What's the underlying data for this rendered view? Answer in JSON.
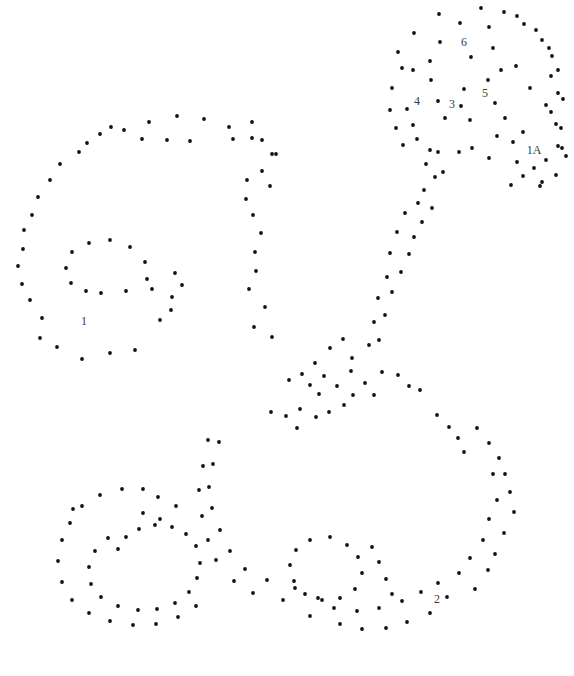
{
  "figure": {
    "title": "",
    "background_color": "#ffffff",
    "marker_color": "#111111",
    "label_color": "#3a3a3a",
    "marker_radius": 1.9,
    "width": 574,
    "height": 676
  },
  "chart_data": {
    "type": "scatter",
    "title": "",
    "xlabel": "",
    "ylabel": "",
    "xlim": [
      0,
      574
    ],
    "ylim": [
      676,
      0
    ],
    "grid": false,
    "legend": null,
    "axes_visible": false,
    "annotations": [
      {
        "text": "1",
        "x": 84,
        "y": 322
      },
      {
        "text": "1A",
        "x": 534,
        "y": 151
      },
      {
        "text": "2",
        "x": 437,
        "y": 600
      },
      {
        "text": "3",
        "x": 452,
        "y": 105
      },
      {
        "text": "4",
        "x": 417,
        "y": 102
      },
      {
        "text": "5",
        "x": 485,
        "y": 94
      },
      {
        "text": "6",
        "x": 464,
        "y": 43
      }
    ],
    "series": [
      {
        "name": "points",
        "marker": "filled-circle",
        "color": "#111111",
        "points": [
          [
            439,
            14
          ],
          [
            481,
            8
          ],
          [
            504,
            12
          ],
          [
            460,
            23
          ],
          [
            524,
            24
          ],
          [
            542,
            40
          ],
          [
            414,
            33
          ],
          [
            430,
            61
          ],
          [
            493,
            48
          ],
          [
            552,
            56
          ],
          [
            501,
            70
          ],
          [
            413,
            70
          ],
          [
            551,
            76
          ],
          [
            440,
            42
          ],
          [
            471,
            57
          ],
          [
            516,
            66
          ],
          [
            558,
            93
          ],
          [
            530,
            88
          ],
          [
            546,
            105
          ],
          [
            402,
            68
          ],
          [
            431,
            80
          ],
          [
            464,
            89
          ],
          [
            488,
            80
          ],
          [
            495,
            103
          ],
          [
            438,
            101
          ],
          [
            461,
            106
          ],
          [
            392,
            88
          ],
          [
            407,
            109
          ],
          [
            413,
            125
          ],
          [
            445,
            118
          ],
          [
            470,
            120
          ],
          [
            505,
            118
          ],
          [
            523,
            132
          ],
          [
            551,
            112
          ],
          [
            561,
            128
          ],
          [
            417,
            139
          ],
          [
            430,
            150
          ],
          [
            497,
            136
          ],
          [
            513,
            142
          ],
          [
            562,
            148
          ],
          [
            438,
            152
          ],
          [
            459,
            152
          ],
          [
            472,
            148
          ],
          [
            489,
            158
          ],
          [
            517,
            162
          ],
          [
            546,
            160
          ],
          [
            542,
            182
          ],
          [
            426,
            164
          ],
          [
            435,
            177
          ],
          [
            443,
            172
          ],
          [
            424,
            190
          ],
          [
            418,
            203
          ],
          [
            432,
            208
          ],
          [
            422,
            222
          ],
          [
            405,
            213
          ],
          [
            414,
            237
          ],
          [
            397,
            232
          ],
          [
            409,
            254
          ],
          [
            390,
            253
          ],
          [
            401,
            272
          ],
          [
            387,
            277
          ],
          [
            392,
            292
          ],
          [
            378,
            298
          ],
          [
            385,
            315
          ],
          [
            374,
            322
          ],
          [
            379,
            340
          ],
          [
            369,
            345
          ],
          [
            149,
            122
          ],
          [
            177,
            116
          ],
          [
            204,
            119
          ],
          [
            229,
            127
          ],
          [
            124,
            130
          ],
          [
            111,
            127
          ],
          [
            100,
            134
          ],
          [
            252,
            138
          ],
          [
            272,
            154
          ],
          [
            87,
            143
          ],
          [
            79,
            152
          ],
          [
            167,
            140
          ],
          [
            142,
            139
          ],
          [
            190,
            141
          ],
          [
            60,
            164
          ],
          [
            252,
            122
          ],
          [
            233,
            139
          ],
          [
            50,
            180
          ],
          [
            38,
            197
          ],
          [
            262,
            171
          ],
          [
            270,
            186
          ],
          [
            247,
            180
          ],
          [
            32,
            215
          ],
          [
            24,
            230
          ],
          [
            23,
            249
          ],
          [
            246,
            199
          ],
          [
            253,
            215
          ],
          [
            18,
            266
          ],
          [
            22,
            284
          ],
          [
            261,
            233
          ],
          [
            255,
            252
          ],
          [
            30,
            300
          ],
          [
            42,
            318
          ],
          [
            40,
            338
          ],
          [
            256,
            271
          ],
          [
            249,
            289
          ],
          [
            57,
            347
          ],
          [
            82,
            359
          ],
          [
            265,
            307
          ],
          [
            110,
            353
          ],
          [
            135,
            350
          ],
          [
            254,
            327
          ],
          [
            272,
            337
          ],
          [
            160,
            320
          ],
          [
            172,
            297
          ],
          [
            152,
            289
          ],
          [
            126,
            291
          ],
          [
            101,
            293
          ],
          [
            86,
            291
          ],
          [
            71,
            283
          ],
          [
            66,
            268
          ],
          [
            72,
            252
          ],
          [
            89,
            243
          ],
          [
            110,
            240
          ],
          [
            130,
            247
          ],
          [
            145,
            262
          ],
          [
            147,
            279
          ],
          [
            175,
            273
          ],
          [
            182,
            285
          ],
          [
            171,
            310
          ],
          [
            315,
            363
          ],
          [
            330,
            348
          ],
          [
            343,
            339
          ],
          [
            324,
            376
          ],
          [
            310,
            385
          ],
          [
            302,
            374
          ],
          [
            289,
            380
          ],
          [
            319,
            394
          ],
          [
            337,
            386
          ],
          [
            351,
            371
          ],
          [
            352,
            358
          ],
          [
            344,
            405
          ],
          [
            329,
            412
          ],
          [
            316,
            417
          ],
          [
            300,
            409
          ],
          [
            297,
            428
          ],
          [
            286,
            416
          ],
          [
            271,
            412
          ],
          [
            353,
            395
          ],
          [
            365,
            383
          ],
          [
            374,
            395
          ],
          [
            382,
            372
          ],
          [
            398,
            375
          ],
          [
            409,
            386
          ],
          [
            420,
            390
          ],
          [
            437,
            415
          ],
          [
            449,
            427
          ],
          [
            458,
            438
          ],
          [
            464,
            452
          ],
          [
            477,
            428
          ],
          [
            489,
            443
          ],
          [
            499,
            458
          ],
          [
            493,
            474
          ],
          [
            505,
            474
          ],
          [
            510,
            492
          ],
          [
            497,
            500
          ],
          [
            514,
            512
          ],
          [
            489,
            519
          ],
          [
            504,
            533
          ],
          [
            483,
            540
          ],
          [
            495,
            554
          ],
          [
            470,
            558
          ],
          [
            488,
            570
          ],
          [
            459,
            573
          ],
          [
            475,
            589
          ],
          [
            438,
            583
          ],
          [
            447,
            597
          ],
          [
            421,
            592
          ],
          [
            430,
            613
          ],
          [
            402,
            601
          ],
          [
            407,
            622
          ],
          [
            379,
            608
          ],
          [
            386,
            628
          ],
          [
            357,
            611
          ],
          [
            362,
            629
          ],
          [
            334,
            608
          ],
          [
            340,
            624
          ],
          [
            318,
            598
          ],
          [
            310,
            616
          ],
          [
            295,
            588
          ],
          [
            283,
            600
          ],
          [
            267,
            580
          ],
          [
            253,
            593
          ],
          [
            245,
            569
          ],
          [
            234,
            581
          ],
          [
            230,
            551
          ],
          [
            216,
            560
          ],
          [
            220,
            530
          ],
          [
            208,
            540
          ],
          [
            212,
            508
          ],
          [
            202,
            516
          ],
          [
            209,
            487
          ],
          [
            199,
            490
          ],
          [
            213,
            464
          ],
          [
            203,
            466
          ],
          [
            219,
            442
          ],
          [
            208,
            440
          ],
          [
            108,
            538
          ],
          [
            95,
            551
          ],
          [
            89,
            567
          ],
          [
            91,
            584
          ],
          [
            101,
            597
          ],
          [
            118,
            606
          ],
          [
            138,
            610
          ],
          [
            157,
            609
          ],
          [
            175,
            603
          ],
          [
            189,
            592
          ],
          [
            197,
            578
          ],
          [
            200,
            563
          ],
          [
            196,
            546
          ],
          [
            186,
            534
          ],
          [
            172,
            527
          ],
          [
            155,
            525
          ],
          [
            139,
            529
          ],
          [
            126,
            537
          ],
          [
            118,
            549
          ],
          [
            70,
            523
          ],
          [
            62,
            540
          ],
          [
            58,
            561
          ],
          [
            62,
            582
          ],
          [
            72,
            600
          ],
          [
            89,
            613
          ],
          [
            110,
            621
          ],
          [
            133,
            625
          ],
          [
            156,
            624
          ],
          [
            178,
            617
          ],
          [
            196,
            606
          ],
          [
            82,
            506
          ],
          [
            100,
            495
          ],
          [
            122,
            489
          ],
          [
            143,
            489
          ],
          [
            73,
            509
          ],
          [
            158,
            497
          ],
          [
            176,
            506
          ],
          [
            160,
            519
          ],
          [
            143,
            513
          ],
          [
            330,
            537
          ],
          [
            347,
            545
          ],
          [
            358,
            557
          ],
          [
            362,
            573
          ],
          [
            355,
            589
          ],
          [
            340,
            598
          ],
          [
            322,
            600
          ],
          [
            305,
            594
          ],
          [
            294,
            581
          ],
          [
            290,
            565
          ],
          [
            296,
            550
          ],
          [
            310,
            540
          ],
          [
            372,
            547
          ],
          [
            379,
            562
          ],
          [
            386,
            579
          ],
          [
            392,
            594
          ],
          [
            558,
            146
          ],
          [
            566,
            156
          ],
          [
            540,
            186
          ],
          [
            556,
            175
          ],
          [
            534,
            168
          ],
          [
            523,
            176
          ],
          [
            511,
            185
          ],
          [
            489,
            27
          ],
          [
            517,
            16
          ],
          [
            536,
            30
          ],
          [
            549,
            48
          ],
          [
            558,
            70
          ],
          [
            563,
            99
          ],
          [
            556,
            124
          ],
          [
            398,
            52
          ],
          [
            390,
            110
          ],
          [
            396,
            128
          ],
          [
            403,
            145
          ],
          [
            276,
            154
          ],
          [
            262,
            140
          ]
        ]
      }
    ]
  }
}
